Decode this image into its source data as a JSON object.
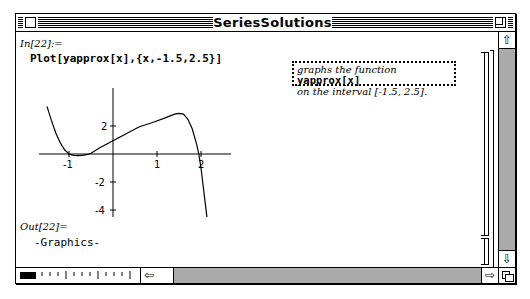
{
  "window": {
    "title": "SeriesSolutions"
  },
  "notebook": {
    "input_cell": {
      "label": "In[22]:=",
      "code": "Plot[yapprox[x],{x,-1.5,2.5}]"
    },
    "text_cell": {
      "line1_prefix": "graphs the function ",
      "line1_code": "yapprox[x]",
      "line2": "on the interval [-1.5, 2.5]."
    },
    "output_cell": {
      "label": "Out[22]=",
      "value": "-Graphics-"
    }
  },
  "scrollbars": {
    "up_arrow": "⇧",
    "down_arrow": "⇩",
    "left_arrow": "⇦",
    "right_arrow": "⇨"
  },
  "chart_data": {
    "type": "line",
    "title": "",
    "xlabel": "",
    "ylabel": "",
    "xlim": [
      -1.5,
      2.5
    ],
    "ylim": [
      -5,
      3.5
    ],
    "x_ticks": [
      "-1",
      "1",
      "2"
    ],
    "y_ticks": [
      "2",
      "-2",
      "-4"
    ],
    "grid": false,
    "series": [
      {
        "name": "yapprox[x]",
        "x": [
          -1.5,
          -1.4,
          -1.3,
          -1.2,
          -1.1,
          -1.0,
          -0.9,
          -0.8,
          -0.7,
          -0.6,
          -0.5,
          -0.3,
          0.0,
          0.3,
          0.6,
          0.9,
          1.2,
          1.4,
          1.5,
          1.6,
          1.7,
          1.8,
          1.9,
          1.95,
          2.0,
          2.05,
          2.1,
          2.15
        ],
        "y": [
          3.4,
          2.4,
          1.5,
          0.8,
          0.3,
          0.0,
          -0.1,
          -0.12,
          -0.1,
          -0.05,
          0.05,
          0.45,
          0.95,
          1.45,
          1.95,
          2.25,
          2.6,
          2.85,
          2.9,
          2.85,
          2.5,
          1.8,
          0.7,
          0.0,
          -1.0,
          -2.3,
          -3.6,
          -4.9
        ]
      }
    ]
  }
}
